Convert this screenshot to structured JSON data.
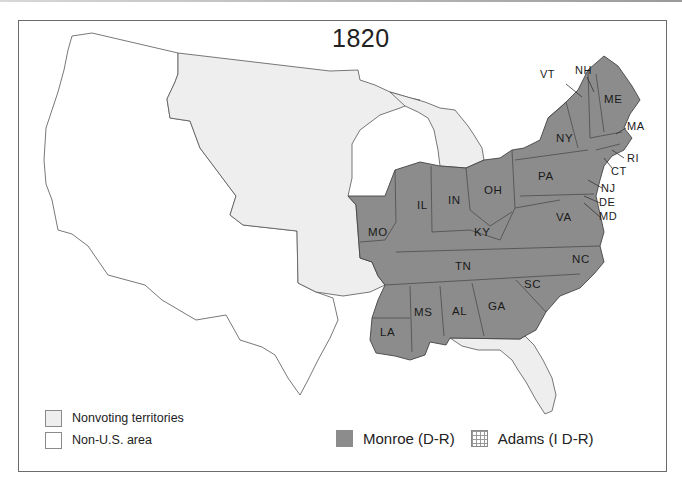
{
  "map": {
    "title": "1820",
    "colors": {
      "monroe": "#8c8c8c",
      "nonvoting": "#eeeeee",
      "non_us": "#ffffff",
      "border": "#444444",
      "frame": "#6a6a6a"
    },
    "states_monroe": [
      {
        "abbr": "ME",
        "x": 612,
        "y": 99
      },
      {
        "abbr": "NY",
        "x": 556,
        "y": 138
      },
      {
        "abbr": "PA",
        "x": 538,
        "y": 176
      },
      {
        "abbr": "OH",
        "x": 488,
        "y": 190
      },
      {
        "abbr": "IN",
        "x": 446,
        "y": 200
      },
      {
        "abbr": "IL",
        "x": 415,
        "y": 205
      },
      {
        "abbr": "MO",
        "x": 366,
        "y": 232
      },
      {
        "abbr": "KY",
        "x": 474,
        "y": 232
      },
      {
        "abbr": "VA",
        "x": 562,
        "y": 217
      },
      {
        "abbr": "NC",
        "x": 578,
        "y": 259
      },
      {
        "abbr": "TN",
        "x": 453,
        "y": 266
      },
      {
        "abbr": "SC",
        "x": 528,
        "y": 284
      },
      {
        "abbr": "GA",
        "x": 490,
        "y": 306
      },
      {
        "abbr": "AL",
        "x": 451,
        "y": 311
      },
      {
        "abbr": "MS",
        "x": 415,
        "y": 312
      },
      {
        "abbr": "LA",
        "x": 382,
        "y": 332
      }
    ],
    "callouts": [
      {
        "abbr": "VT",
        "x": 551,
        "y": 76
      },
      {
        "abbr": "NH",
        "x": 575,
        "y": 72
      },
      {
        "abbr": "MA",
        "x": 627,
        "y": 130
      },
      {
        "abbr": "RI",
        "x": 626,
        "y": 162
      },
      {
        "abbr": "CT",
        "x": 611,
        "y": 175
      },
      {
        "abbr": "NJ",
        "x": 601,
        "y": 192
      },
      {
        "abbr": "DE",
        "x": 599,
        "y": 206
      },
      {
        "abbr": "MD",
        "x": 599,
        "y": 220
      }
    ]
  },
  "legend": {
    "nonvoting": "Nonvoting territories",
    "non_us": "Non-U.S. area",
    "monroe": "Monroe (D-R)",
    "adams": "Adams (I D-R)"
  }
}
